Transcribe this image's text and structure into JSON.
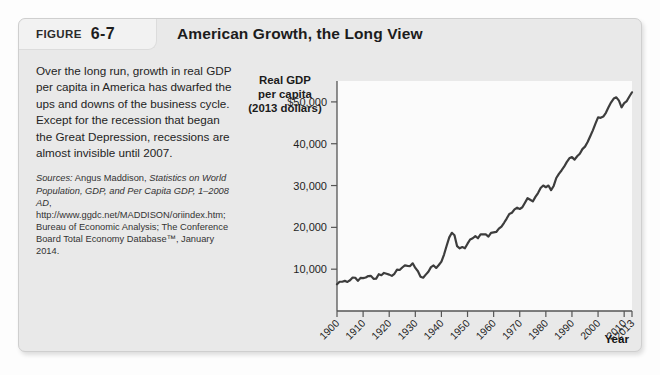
{
  "figure": {
    "label_word": "FIGURE",
    "number": "6-7",
    "title": "American Growth, the Long View"
  },
  "caption": {
    "body": "Over the long run, growth in real GDP per capita in America has dwarfed the ups and downs of the business cycle. Except for the recession that began the Great Depression, recessions are almost invisible until 2007.",
    "sources_label": "Sources:",
    "sources_text_1": " Angus Maddison, ",
    "sources_italic_1": "Statistics on World Population, GDP, and Per Capita GDP, 1–2008 AD",
    "sources_text_2": ", http://www.ggdc.net/MADDISON/oriindex.htm; Bureau of Economic Analysis; The Conference Board Total Economy Database™, January 2014."
  },
  "chart_data": {
    "type": "line",
    "title": "American Growth, the Long View",
    "ylabel": "Real GDP per capita (2013 dollars)",
    "xlabel": "Year",
    "xlim": [
      1900,
      2013
    ],
    "ylim": [
      0,
      55000
    ],
    "grid": false,
    "legend": "none",
    "line_color": "#3d3d3d",
    "plot_bg": "#fbfbfb",
    "ytick_labels": [
      "$50,000",
      "40,000",
      "30,000",
      "20,000",
      "10,000"
    ],
    "ytick_values": [
      50000,
      40000,
      30000,
      20000,
      10000
    ],
    "xtick_labels": [
      "1900",
      "1910",
      "1920",
      "1930",
      "1940",
      "1950",
      "1960",
      "1970",
      "1980",
      "1990",
      "2000",
      "2010",
      "2013"
    ],
    "xtick_values": [
      1900,
      1910,
      1920,
      1930,
      1940,
      1950,
      1960,
      1970,
      1980,
      1990,
      2000,
      2010,
      2013
    ],
    "series": [
      {
        "name": "Real GDP per capita (2013 dollars)",
        "x": [
          1900,
          1901,
          1902,
          1903,
          1904,
          1905,
          1906,
          1907,
          1908,
          1909,
          1910,
          1911,
          1912,
          1913,
          1914,
          1915,
          1916,
          1917,
          1918,
          1919,
          1920,
          1921,
          1922,
          1923,
          1924,
          1925,
          1926,
          1927,
          1928,
          1929,
          1930,
          1931,
          1932,
          1933,
          1934,
          1935,
          1936,
          1937,
          1938,
          1939,
          1940,
          1941,
          1942,
          1943,
          1944,
          1945,
          1946,
          1947,
          1948,
          1949,
          1950,
          1951,
          1952,
          1953,
          1954,
          1955,
          1956,
          1957,
          1958,
          1959,
          1960,
          1961,
          1962,
          1963,
          1964,
          1965,
          1966,
          1967,
          1968,
          1969,
          1970,
          1971,
          1972,
          1973,
          1974,
          1975,
          1976,
          1977,
          1978,
          1979,
          1980,
          1981,
          1982,
          1983,
          1984,
          1985,
          1986,
          1987,
          1988,
          1989,
          1990,
          1991,
          1992,
          1993,
          1994,
          1995,
          1996,
          1997,
          1998,
          1999,
          2000,
          2001,
          2002,
          2003,
          2004,
          2005,
          2006,
          2007,
          2008,
          2009,
          2010,
          2011,
          2012,
          2013
        ],
        "y": [
          6400,
          7000,
          7000,
          7200,
          6950,
          7350,
          8000,
          7950,
          7200,
          7900,
          7850,
          8000,
          8350,
          8400,
          7700,
          7750,
          8800,
          8550,
          9100,
          8900,
          8700,
          8400,
          8900,
          9900,
          9800,
          10400,
          10900,
          10800,
          10750,
          11400,
          10300,
          9500,
          8200,
          7950,
          8700,
          9400,
          10500,
          10900,
          10300,
          11000,
          11800,
          13500,
          15600,
          17600,
          18700,
          18100,
          15500,
          15000,
          15300,
          15000,
          16100,
          17100,
          17400,
          17900,
          17400,
          18300,
          18300,
          18300,
          17800,
          18700,
          18800,
          18900,
          19700,
          20200,
          21100,
          22100,
          23200,
          23500,
          24300,
          24700,
          24400,
          24800,
          25900,
          27000,
          26600,
          26200,
          27300,
          28200,
          29400,
          30000,
          29600,
          30000,
          28900,
          29900,
          31800,
          32800,
          33600,
          34500,
          35600,
          36500,
          36800,
          36200,
          37000,
          37600,
          38700,
          39300,
          40400,
          41800,
          43200,
          44800,
          46300,
          46200,
          46500,
          47400,
          48700,
          49900,
          50800,
          51100,
          50300,
          48700,
          49700,
          50200,
          51300,
          52300
        ]
      }
    ],
    "annotations": [
      {
        "label": "Great Depression trough",
        "x": 1933,
        "y": 7950
      },
      {
        "label": "World War II peak",
        "x": 1944,
        "y": 18700
      },
      {
        "label": "Great Recession dip",
        "x": 2009,
        "y": 48700
      }
    ]
  }
}
